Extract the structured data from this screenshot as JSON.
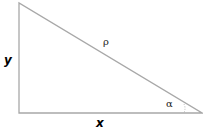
{
  "diagram": {
    "type": "right-triangle",
    "labels": {
      "vertical_side": "y",
      "horizontal_side": "x",
      "hypotenuse": "ρ",
      "angle": "α"
    },
    "colors": {
      "line": "#a8a8a8",
      "text": "#000000"
    }
  }
}
